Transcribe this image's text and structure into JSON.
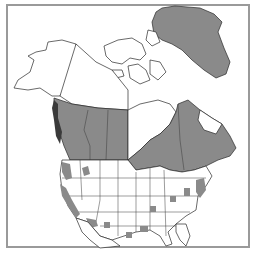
{
  "map": {
    "title": "",
    "region": "North America",
    "legend": {
      "shaded_color": "#8a8a8a",
      "unshaded_color": "#ffffff",
      "frame_color": "#9a9a9a"
    },
    "shaded_regions": [
      "Greenland",
      "British Columbia",
      "Alberta",
      "Saskatchewan",
      "Manitoba",
      "Ontario",
      "Quebec",
      "Newfoundland and Labrador",
      "Pacific Northwest coast",
      "California",
      "Arizona patches",
      "Eastern US scattered patches"
    ]
  }
}
